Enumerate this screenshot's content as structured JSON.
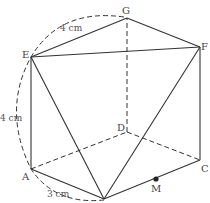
{
  "diagram": {
    "type": "prism-solid-geometry",
    "vertices": {
      "A": {
        "label": "A",
        "x": 31,
        "y": 169
      },
      "B": {
        "label": "",
        "x": 104,
        "y": 199
      },
      "C": {
        "label": "C",
        "x": 200,
        "y": 160
      },
      "D": {
        "label": "D",
        "x": 127,
        "y": 132
      },
      "E": {
        "label": "E",
        "x": 31,
        "y": 57
      },
      "F": {
        "label": "F",
        "x": 200,
        "y": 47
      },
      "G": {
        "label": "G",
        "x": 127,
        "y": 18
      },
      "M": {
        "label": "M",
        "x": 156,
        "y": 179
      }
    },
    "dimensions": {
      "EG": "4 cm",
      "AE": "4 cm",
      "AB": "3 cm"
    },
    "colors": {
      "line": "#333333",
      "label": "#444444",
      "background": "#ffffff"
    }
  }
}
